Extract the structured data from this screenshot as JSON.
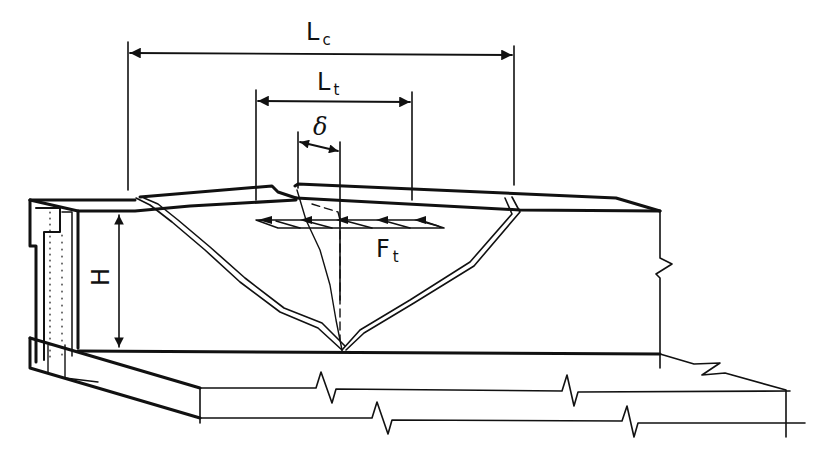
{
  "diagram": {
    "labels": {
      "Lc": {
        "main": "L",
        "sub": "c"
      },
      "Lt": {
        "main": "L",
        "sub": "t"
      },
      "delta": {
        "main": "δ"
      },
      "Ft": {
        "main": "F",
        "sub": "t"
      },
      "H": {
        "main": "H"
      }
    },
    "dimensions": [
      {
        "name": "Lc",
        "description": "Overall length of cracked zone at top of wall"
      },
      {
        "name": "Lt",
        "description": "Length over which tensile force acts"
      },
      {
        "name": "delta",
        "description": "Displacement / crack opening"
      },
      {
        "name": "H",
        "description": "Wall height"
      }
    ],
    "colors": {
      "line": "#111111",
      "background": "#ffffff"
    }
  }
}
